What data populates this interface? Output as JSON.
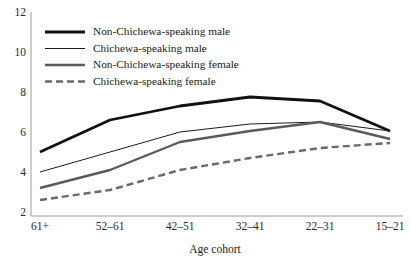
{
  "chart_data": {
    "type": "line",
    "title": "",
    "xlabel": "Age cohort",
    "ylabel": "",
    "categories": [
      "61+",
      "52–61",
      "42–51",
      "32–41",
      "22–31",
      "15–21"
    ],
    "yticks": [
      2,
      4,
      6,
      8,
      10,
      12
    ],
    "ylim": [
      2,
      12
    ],
    "grid": false,
    "legend_position": "top-left",
    "series": [
      {
        "name": "Non-Chichewa-speaking male",
        "values": [
          5.0,
          6.6,
          7.3,
          7.75,
          7.55,
          6.05
        ],
        "color": "#111111",
        "width": 2.8,
        "dash": "none"
      },
      {
        "name": "Chichewa-speaking male",
        "values": [
          4.0,
          5.0,
          6.0,
          6.4,
          6.5,
          6.05
        ],
        "color": "#1a1a1a",
        "width": 1.0,
        "dash": "none"
      },
      {
        "name": "Non-Chichewa-speaking female",
        "values": [
          3.2,
          4.1,
          5.5,
          6.05,
          6.5,
          5.65
        ],
        "color": "#5a5a5a",
        "width": 2.4,
        "dash": "none"
      },
      {
        "name": "Chichewa-speaking female",
        "values": [
          2.6,
          3.1,
          4.1,
          4.7,
          5.2,
          5.45
        ],
        "color": "#6a6a6a",
        "width": 2.4,
        "dash": "7,4"
      }
    ]
  },
  "axis": {
    "line_color": "#9a9a9a"
  }
}
